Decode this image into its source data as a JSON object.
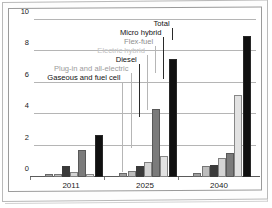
{
  "chart_data": {
    "type": "bar",
    "title": "",
    "subtitle": "",
    "xlabel": "",
    "ylabel": "",
    "ylim": [
      0,
      10
    ],
    "yticks": [
      0,
      2,
      4,
      6,
      8,
      10
    ],
    "ytick_labels": [
      "0",
      "2",
      "4",
      "6",
      "8",
      "10"
    ],
    "grid": true,
    "legend_position": "inline-callouts",
    "categories": [
      "2011",
      "2025",
      "2040"
    ],
    "series": [
      {
        "name": "Gaseous and fuel cell",
        "color": "#9e9e9e",
        "values": [
          0.07,
          0.1,
          0.12
        ]
      },
      {
        "name": "Plug-in and all-electric",
        "color": "#bdbdbd",
        "values": [
          0.03,
          0.28,
          0.55
        ]
      },
      {
        "name": "Diesel",
        "color": "#3a3a3a",
        "values": [
          0.55,
          0.6,
          0.62
        ]
      },
      {
        "name": "Electric hybrid",
        "color": "#d4d4d4",
        "values": [
          0.18,
          0.82,
          1.08
        ]
      },
      {
        "name": "Flex-fuel",
        "color": "#7b7b7b",
        "values": [
          1.6,
          4.18,
          1.38
        ]
      },
      {
        "name": "Micro hybrid",
        "color": "#e2e2e2",
        "values": [
          0.02,
          1.22,
          5.1
        ]
      },
      {
        "name": "Total",
        "color": "#101010",
        "values": [
          2.52,
          7.38,
          8.88
        ]
      }
    ],
    "annotations": [
      {
        "label": "Total",
        "color": "#101010"
      },
      {
        "label": "Micro hybrid",
        "color": "#101010"
      },
      {
        "label": "Flex-fuel",
        "color": "#8d8d8d"
      },
      {
        "label": "Electric hybrid",
        "color": "#c2c2c2"
      },
      {
        "label": "Diesel",
        "color": "#101010"
      },
      {
        "label": "Plug-in and all-electric",
        "color": "#9b9b9b"
      },
      {
        "label": "Gaseous and fuel cell",
        "color": "#101010"
      }
    ]
  }
}
